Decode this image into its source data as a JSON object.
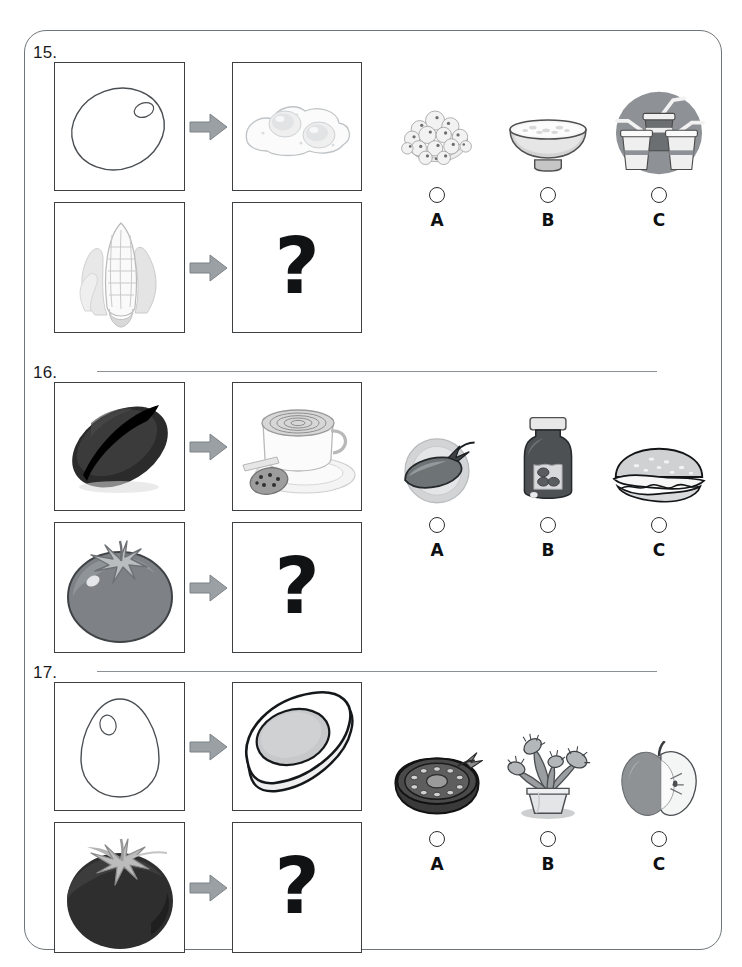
{
  "worksheet": {
    "title": "Food source matching worksheet",
    "arrow_icon": "right-arrow-icon",
    "unknown_symbol": "?",
    "questions": [
      {
        "number": "15.",
        "example": {
          "source_label": "egg outline",
          "source_icon": "egg-outline-icon",
          "result_label": "fried eggs",
          "result_icon": "fried-eggs-icon"
        },
        "prompt": {
          "source_label": "corn cob",
          "source_icon": "corn-cob-icon",
          "result_label": "?",
          "result_icon": "question-mark-icon"
        },
        "options": [
          {
            "letter": "A",
            "label": "bowl of popcorn",
            "icon": "popcorn-bowl-icon"
          },
          {
            "letter": "B",
            "label": "bowl of rice",
            "icon": "rice-bowl-icon"
          },
          {
            "letter": "C",
            "label": "soft drink cups with straws",
            "icon": "drink-cups-icon"
          }
        ]
      },
      {
        "number": "16.",
        "example": {
          "source_label": "coffee bean",
          "source_icon": "coffee-bean-icon",
          "result_label": "cup of coffee with cookie",
          "result_icon": "coffee-cup-icon"
        },
        "prompt": {
          "source_label": "tomato",
          "source_icon": "tomato-icon",
          "result_label": "?",
          "result_icon": "question-mark-icon"
        },
        "options": [
          {
            "letter": "A",
            "label": "eggplant on a plate",
            "icon": "eggplant-plate-icon"
          },
          {
            "letter": "B",
            "label": "jar of sauce",
            "icon": "sauce-jar-icon"
          },
          {
            "letter": "C",
            "label": "hamburger",
            "icon": "hamburger-icon"
          }
        ]
      },
      {
        "number": "17.",
        "example": {
          "source_label": "egg outline",
          "source_icon": "egg-outline-icon",
          "result_label": "halved boiled egg",
          "result_icon": "halved-egg-icon"
        },
        "prompt": {
          "source_label": "tomato",
          "source_icon": "tomato-icon",
          "result_label": "?",
          "result_icon": "question-mark-icon"
        },
        "options": [
          {
            "letter": "A",
            "label": "halved tomato",
            "icon": "halved-tomato-icon"
          },
          {
            "letter": "B",
            "label": "venus flytrap plant in pot",
            "icon": "flytrap-plant-icon"
          },
          {
            "letter": "C",
            "label": "apple with cut half",
            "icon": "apple-halved-icon"
          }
        ]
      }
    ]
  },
  "colors": {
    "page_border": "#6f7579",
    "panel_border": "#3c4043",
    "arrow_fill": "#9aa0a4",
    "text": "#0d0f11",
    "separator": "#8b9094"
  }
}
